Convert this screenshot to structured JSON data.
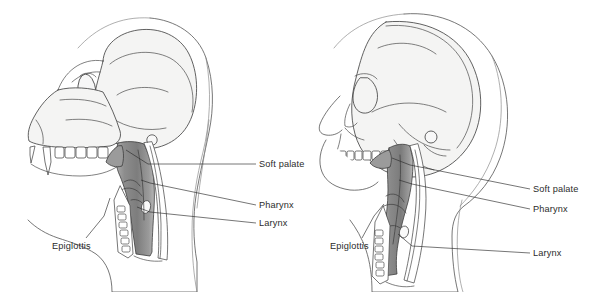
{
  "figure": {
    "background_color": "#ffffff",
    "line_color": "#3a3a3a",
    "bone_fill_color": "#f4f4f3",
    "tract_fill_color": "#8f8f8f",
    "label_color": "#2b2b2b"
  },
  "panels": [
    {
      "id": "chimpanzee",
      "name": "chimpanzee-vocal-tract-diagram",
      "labels": [
        {
          "id": "soft-palate",
          "text": "Soft palate",
          "x": 259,
          "y": 167
        },
        {
          "id": "pharynx",
          "text": "Pharynx",
          "x": 259,
          "y": 208
        },
        {
          "id": "larynx",
          "text": "Larynx",
          "x": 259,
          "y": 226
        },
        {
          "id": "epiglottis",
          "text": "Epiglottis",
          "x": 52,
          "y": 249
        }
      ]
    },
    {
      "id": "human",
      "name": "human-vocal-tract-diagram",
      "labels": [
        {
          "id": "soft-palate",
          "text": "Soft palate",
          "x": 533,
          "y": 192
        },
        {
          "id": "pharynx",
          "text": "Pharynx",
          "x": 533,
          "y": 212
        },
        {
          "id": "larynx",
          "text": "Larynx",
          "x": 533,
          "y": 256
        },
        {
          "id": "epiglottis",
          "text": "Epiglottis",
          "x": 330,
          "y": 249
        }
      ]
    }
  ]
}
